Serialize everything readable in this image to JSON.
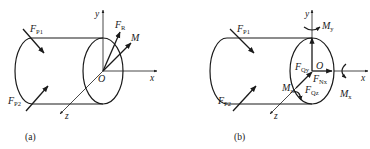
{
  "diagram_a": {
    "caption": "(a)",
    "labels": {
      "F_P1": {
        "main": "F",
        "sub": "P1"
      },
      "F_P2": {
        "main": "F",
        "sub": "P2"
      },
      "F_R": {
        "main": "F",
        "sub": "R"
      },
      "M": "M",
      "y": "y",
      "x": "x",
      "z": "z",
      "O": "O"
    }
  },
  "diagram_b": {
    "caption": "(b)",
    "labels": {
      "F_P1": {
        "main": "F",
        "sub": "P1"
      },
      "F_P2": {
        "main": "F",
        "sub": "P2"
      },
      "F_Qy": {
        "main": "F",
        "sub": "Qy"
      },
      "F_Nx": {
        "main": "F",
        "sub": "Nx"
      },
      "F_Qz": {
        "main": "F",
        "sub": "Qz"
      },
      "M_y": {
        "main": "M",
        "sub": "y"
      },
      "M_x": {
        "main": "M",
        "sub": "x"
      },
      "M_z": {
        "main": "M",
        "sub": "z"
      },
      "y": "y",
      "x": "x",
      "z": "z",
      "O": "O"
    }
  },
  "colors": {
    "stroke": "#1a1a1a",
    "background": "#ffffff"
  }
}
